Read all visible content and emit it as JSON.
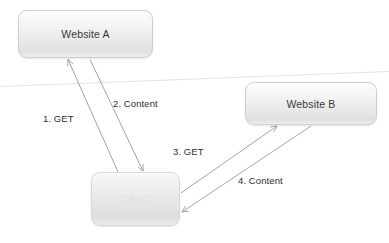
{
  "diagram": {
    "background_color": "#ffffff",
    "line_color": "#9a9a9a",
    "node_text_color": "#3a3a3a",
    "client_text_color": "#f2f2f2",
    "divider_color": "#e6e6e6"
  },
  "nodes": [
    {
      "id": "website-a",
      "label": "Website A"
    },
    {
      "id": "website-b",
      "label": "Website B"
    },
    {
      "id": "client",
      "label": "\"Client\""
    }
  ],
  "edges": [
    {
      "id": "edge-1",
      "label": "1. GET",
      "from": "client",
      "to": "website-a",
      "direction": "up-left"
    },
    {
      "id": "edge-2",
      "label": "2. Content",
      "from": "website-a",
      "to": "client",
      "direction": "down-right"
    },
    {
      "id": "edge-3",
      "label": "3. GET",
      "from": "client",
      "to": "website-b",
      "direction": "up-right"
    },
    {
      "id": "edge-4",
      "label": "4. Content",
      "from": "website-b",
      "to": "client",
      "direction": "down-left"
    }
  ]
}
